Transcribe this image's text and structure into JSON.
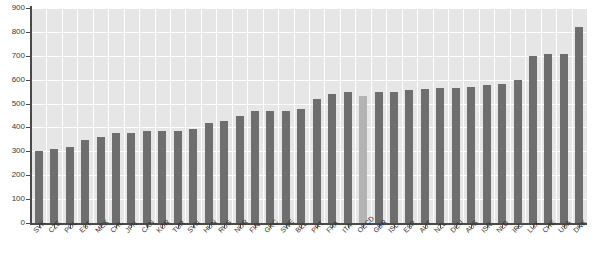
{
  "chart_data": {
    "type": "bar",
    "title": "",
    "subtitle": "",
    "xlabel": "",
    "ylabel": "",
    "ylim": [
      0,
      900
    ],
    "ytick_step": 100,
    "yticks": [
      0,
      100,
      200,
      300,
      400,
      500,
      600,
      700,
      800,
      900
    ],
    "ytick_labels": [
      "0",
      "100",
      "200",
      "300",
      "400",
      "500",
      "600",
      "700",
      "800",
      "900"
    ],
    "grid": true,
    "legend": "none",
    "highlight_category": "OECD",
    "colors": {
      "bar": "#6e6e6e",
      "bar_highlight": "#b3b3b3",
      "plot_background": "#e6e6e6",
      "gridline": "#ffffff",
      "axis": "#4a4a4a",
      "text": "#2e2e2e",
      "page_background": "#ffffff"
    },
    "categories": [
      "SVK",
      "CZE",
      "POL",
      "EST",
      "MEX",
      "CHL",
      "JPN",
      "CAN",
      "KOR",
      "TUR",
      "SVN",
      "HUN",
      "RUS",
      "NOR",
      "FIN",
      "GRC",
      "SWE",
      "BEL",
      "PRT",
      "FRA",
      "ITA",
      "OECD",
      "GBR",
      "ISL",
      "ESP",
      "AUT",
      "NZL",
      "DEU",
      "AUS",
      "ISR",
      "NLD",
      "IRL",
      "LUX",
      "CHE",
      "USA",
      "DNK"
    ],
    "values": [
      300,
      310,
      318,
      348,
      358,
      376,
      376,
      386,
      386,
      386,
      395,
      420,
      428,
      448,
      468,
      468,
      468,
      478,
      518,
      540,
      548,
      532,
      548,
      548,
      556,
      560,
      566,
      566,
      570,
      578,
      582,
      598,
      700,
      708,
      706,
      820
    ]
  }
}
